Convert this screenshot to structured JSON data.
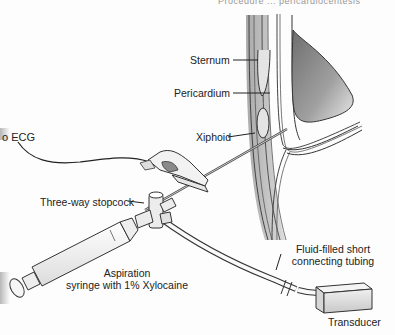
{
  "figure": {
    "header_fragment": "Procedure ... pericardiocentesis",
    "labels": {
      "sternum": "Sternum",
      "pericardium": "Pericardium",
      "xiphoid": "Xiphoid",
      "ecg": "o ECG",
      "stopcock": "Three-way stopcock",
      "syringe_line1": "Aspiration",
      "syringe_line2": "syringe with 1% Xylocaine",
      "tubing_line1": "Fluid-filled short",
      "tubing_line2": "connecting tubing",
      "transducer": "Transducer"
    },
    "colors": {
      "ink": "#222222",
      "heart_shade": "#8a8a8a",
      "chest_wall_shade": "#b5b5b5",
      "background": "#fdfdfd"
    },
    "components": [
      "sternum",
      "pericardium",
      "xiphoid",
      "heart",
      "needle",
      "alligator-clip",
      "ecg-lead",
      "three-way-stopcock",
      "aspiration-syringe",
      "connecting-tubing",
      "transducer"
    ]
  }
}
